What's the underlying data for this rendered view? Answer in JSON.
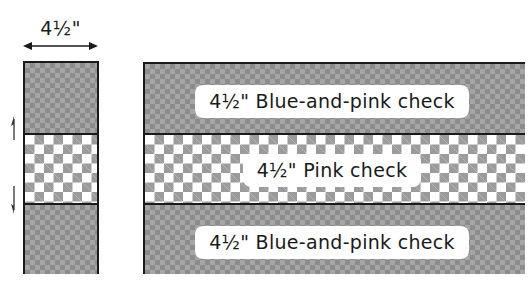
{
  "diagram": {
    "dimension": {
      "label": "4½\"",
      "direction": "horizontal-double-arrow"
    },
    "left_block": {
      "segments": [
        {
          "fabric": "blue-and-pink-check",
          "pattern": "fine dark check"
        },
        {
          "fabric": "pink-check",
          "pattern": "large light check"
        },
        {
          "fabric": "blue-and-pink-check",
          "pattern": "fine dark check"
        }
      ],
      "arrows": [
        "up-arrow",
        "down-arrow"
      ]
    },
    "strip_set": {
      "strips": [
        {
          "label": "4½\" Blue-and-pink check"
        },
        {
          "label": "4½\" Pink check"
        },
        {
          "label": "4½\" Blue-and-pink check"
        }
      ]
    },
    "colors": {
      "outline": "#1a1a1a",
      "dark_check_a": "#8c8c8c",
      "dark_check_b": "#a6a6a6",
      "light_check": "#9b9b9b",
      "background": "#ffffff"
    }
  }
}
